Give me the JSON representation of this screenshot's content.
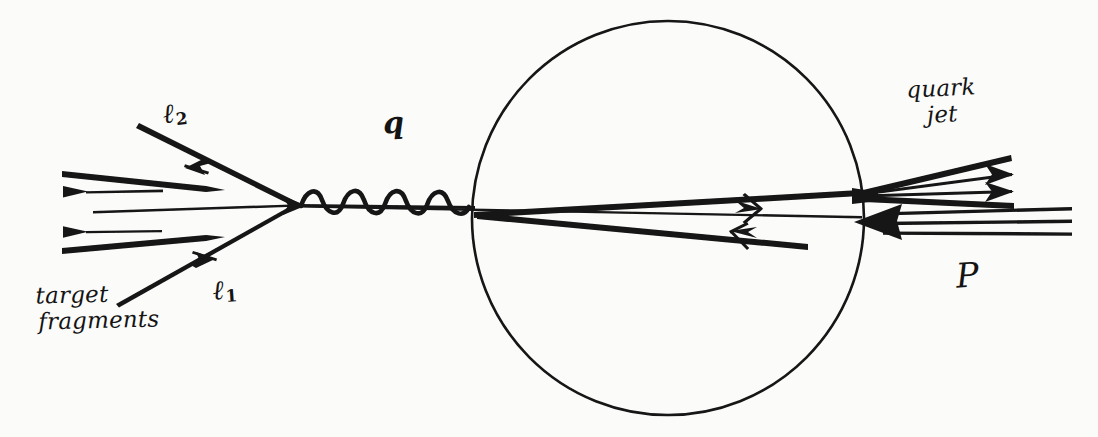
{
  "figure": {
    "kind": "hand-drawn-feynman-dis-diagram",
    "background_color": "#fbfbfa",
    "ink_color": "#141414",
    "width": 1098,
    "height": 437
  },
  "labels": {
    "lepton_out": {
      "symbol": "ℓ",
      "subscript": "2",
      "text": "ℓ2"
    },
    "lepton_in": {
      "symbol": "ℓ",
      "subscript": "1",
      "text": "ℓ1"
    },
    "boson": {
      "text": "q"
    },
    "target_fragments": {
      "line1": "target",
      "line2": "fragments"
    },
    "quark_jet": {
      "line1": "quark",
      "line2": "jet"
    },
    "proton": {
      "text": "P"
    }
  },
  "elements": {
    "blob": {
      "name": "proton-blob-circle",
      "cx": 668,
      "cy": 218,
      "r": 196
    },
    "interaction_vertex": {
      "x": 300,
      "y": 205
    },
    "jet_vertex": {
      "x": 862,
      "y": 193
    },
    "proton_vertex": {
      "x": 856,
      "y": 222
    },
    "boson_propagator": {
      "x_start": 300,
      "x_end": 470,
      "cycles": 4,
      "amplitude": 12
    },
    "target_fragment_count": 5,
    "quark_jet_ray_count": 4,
    "proton_line_count": 3
  }
}
